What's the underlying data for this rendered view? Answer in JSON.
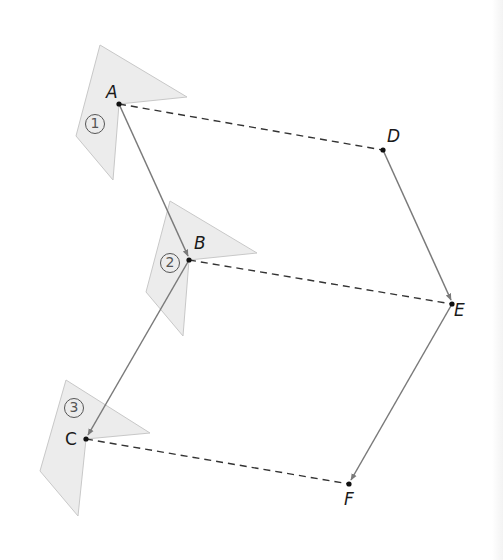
{
  "diagram": {
    "type": "translation-composition",
    "colors": {
      "shape_fill": "#ececec",
      "shape_stroke": "#c8c8c8",
      "solid_arrow": "#7a7a7a",
      "dashed_line": "#333333",
      "point": "#111111"
    },
    "points": {
      "A": {
        "label": "A",
        "x": 119,
        "y": 104
      },
      "B": {
        "label": "B",
        "x": 189,
        "y": 260
      },
      "C": {
        "label": "C",
        "x": 86,
        "y": 439
      },
      "D": {
        "label": "D",
        "x": 383,
        "y": 150
      },
      "E": {
        "label": "E",
        "x": 452,
        "y": 304
      },
      "F": {
        "label": "F",
        "x": 349,
        "y": 484
      }
    },
    "shapes": [
      {
        "id": "1",
        "marker": "1"
      },
      {
        "id": "2",
        "marker": "2"
      },
      {
        "id": "3",
        "marker": "3"
      }
    ],
    "arrows": [
      {
        "from": "A",
        "to": "B",
        "style": "solid"
      },
      {
        "from": "B",
        "to": "C",
        "style": "solid"
      },
      {
        "from": "D",
        "to": "E",
        "style": "solid"
      },
      {
        "from": "E",
        "to": "F",
        "style": "solid"
      }
    ],
    "dashed_segments": [
      {
        "from": "A",
        "to": "D"
      },
      {
        "from": "B",
        "to": "E"
      },
      {
        "from": "C",
        "to": "F"
      }
    ]
  }
}
